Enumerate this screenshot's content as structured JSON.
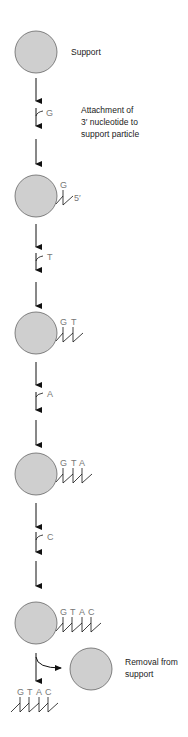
{
  "colors": {
    "bead_fill": "#cfcfcf",
    "bead_stroke": "#666666",
    "line": "#111111",
    "base_text": "#777777",
    "label_text": "#222222"
  },
  "labels": {
    "support": "Support",
    "attachment_line1": "Attachment of",
    "attachment_line2": "3′ nucleotide to",
    "attachment_line3": "support particle",
    "removal_line1": "Removal from",
    "removal_line2": "support",
    "five_prime": "5′"
  },
  "steps": [
    {
      "incoming_base": "G",
      "chain": [
        "G"
      ]
    },
    {
      "incoming_base": "T",
      "chain": [
        "G",
        "T"
      ]
    },
    {
      "incoming_base": "A",
      "chain": [
        "G",
        "T",
        "A"
      ]
    },
    {
      "incoming_base": "C",
      "chain": [
        "G",
        "T",
        "A",
        "C"
      ]
    }
  ],
  "incoming": {
    "g": "G",
    "t": "T",
    "a": "A",
    "c": "C"
  },
  "bead2": {
    "b1": "G"
  },
  "bead3": {
    "b1": "G",
    "b2": "T"
  },
  "bead4": {
    "b1": "G",
    "b2": "T",
    "b3": "A"
  },
  "bead5": {
    "b1": "G",
    "b2": "T",
    "b3": "A",
    "b4": "C"
  },
  "free": {
    "b1": "G",
    "b2": "T",
    "b3": "A",
    "b4": "C"
  }
}
